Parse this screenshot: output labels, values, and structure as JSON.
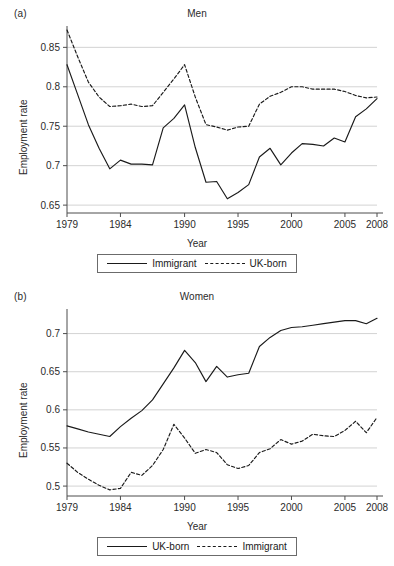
{
  "figure": {
    "axis_label_y": "Employment rate",
    "axis_label_x": "Year",
    "line_color": "#1a1a1a",
    "grid_color": "#c8c8c8",
    "axis_color": "#4d4d4d"
  },
  "panels": [
    {
      "letter": "(a)",
      "title": "Men",
      "legend": [
        {
          "label": "Immigrant",
          "style": "solid"
        },
        {
          "label": "UK-born",
          "style": "dashed"
        }
      ]
    },
    {
      "letter": "(b)",
      "title": "Women",
      "legend": [
        {
          "label": "UK-born",
          "style": "solid"
        },
        {
          "label": "Immigrant",
          "style": "dashed"
        }
      ]
    }
  ],
  "chart_data": [
    {
      "type": "line",
      "title": "Men",
      "panel": "(a)",
      "xlabel": "Year",
      "ylabel": "Employment rate",
      "xlim": [
        1979,
        2008
      ],
      "ylim": [
        0.64,
        0.872
      ],
      "xticks": [
        1979,
        1984,
        1990,
        1995,
        2000,
        2005,
        2008
      ],
      "yticks": [
        0.65,
        0.7,
        0.75,
        0.8,
        0.85
      ],
      "ytick_labels": [
        "0.65",
        "0.7",
        "0.75",
        "0.8",
        "0.85"
      ],
      "grid": "horizontal",
      "legend_position": "below-plot",
      "x": [
        1979,
        1980,
        1981,
        1982,
        1983,
        1984,
        1985,
        1986,
        1987,
        1988,
        1989,
        1990,
        1991,
        1992,
        1993,
        1994,
        1995,
        1996,
        1997,
        1998,
        1999,
        2000,
        2001,
        2002,
        2003,
        2004,
        2005,
        2006,
        2007,
        2008
      ],
      "series": [
        {
          "name": "Immigrant",
          "style": "solid",
          "values": [
            0.828,
            0.79,
            0.752,
            0.722,
            0.696,
            0.707,
            0.702,
            0.702,
            0.701,
            0.748,
            0.76,
            0.777,
            0.723,
            0.679,
            0.68,
            0.658,
            0.666,
            0.676,
            0.711,
            0.722,
            0.701,
            0.716,
            0.728,
            0.727,
            0.725,
            0.735,
            0.73,
            0.762,
            0.772,
            0.785
          ]
        },
        {
          "name": "UK-born",
          "style": "dashed",
          "values": [
            0.872,
            0.838,
            0.806,
            0.787,
            0.775,
            0.776,
            0.778,
            0.775,
            0.776,
            0.793,
            0.81,
            0.828,
            0.787,
            0.752,
            0.749,
            0.745,
            0.749,
            0.75,
            0.778,
            0.788,
            0.793,
            0.8,
            0.8,
            0.797,
            0.797,
            0.797,
            0.794,
            0.789,
            0.786,
            0.787
          ]
        }
      ]
    },
    {
      "type": "line",
      "title": "Women",
      "panel": "(b)",
      "xlabel": "Year",
      "ylabel": "Employment rate",
      "xlim": [
        1979,
        2008
      ],
      "ylim": [
        0.487,
        0.727
      ],
      "xticks": [
        1979,
        1984,
        1990,
        1995,
        2000,
        2005,
        2008
      ],
      "yticks": [
        0.5,
        0.55,
        0.6,
        0.65,
        0.7
      ],
      "ytick_labels": [
        "0.5",
        "0.55",
        "0.6",
        "0.65",
        "0.7"
      ],
      "grid": "horizontal",
      "legend_position": "below-plot",
      "x": [
        1979,
        1980,
        1981,
        1982,
        1983,
        1984,
        1985,
        1986,
        1987,
        1988,
        1989,
        1990,
        1991,
        1992,
        1993,
        1994,
        1995,
        1996,
        1997,
        1998,
        1999,
        2000,
        2001,
        2002,
        2003,
        2004,
        2005,
        2006,
        2007,
        2008
      ],
      "series": [
        {
          "name": "UK-born",
          "style": "solid",
          "values": [
            0.579,
            0.575,
            0.571,
            0.568,
            0.565,
            0.578,
            0.589,
            0.599,
            0.613,
            0.634,
            0.655,
            0.678,
            0.662,
            0.637,
            0.657,
            0.643,
            0.646,
            0.648,
            0.683,
            0.695,
            0.704,
            0.708,
            0.709,
            0.711,
            0.713,
            0.715,
            0.717,
            0.717,
            0.713,
            0.72
          ]
        },
        {
          "name": "Immigrant",
          "style": "dashed",
          "values": [
            0.53,
            0.518,
            0.509,
            0.501,
            0.495,
            0.497,
            0.518,
            0.514,
            0.527,
            0.548,
            0.581,
            0.563,
            0.543,
            0.548,
            0.544,
            0.528,
            0.523,
            0.527,
            0.544,
            0.549,
            0.561,
            0.555,
            0.559,
            0.568,
            0.566,
            0.565,
            0.573,
            0.585,
            0.57,
            0.59
          ]
        }
      ]
    }
  ]
}
